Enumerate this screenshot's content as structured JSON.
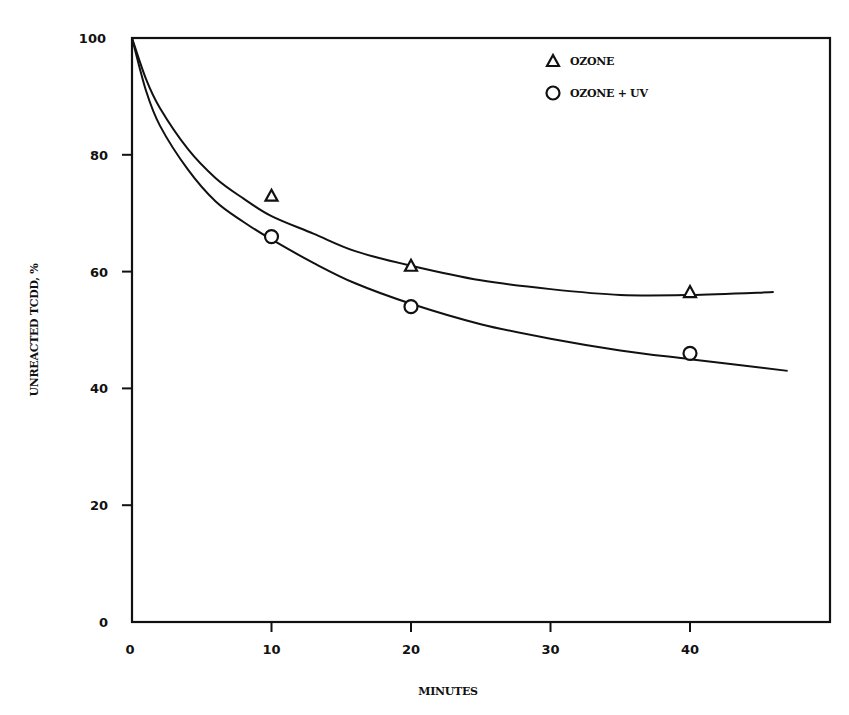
{
  "chart_data": {
    "type": "scatter",
    "title": "",
    "xlabel": "MINUTES",
    "ylabel": "UNREACTED TCDD, %",
    "xlim": [
      0,
      50
    ],
    "ylim": [
      0,
      100
    ],
    "xticks": [
      0,
      10,
      20,
      30,
      40
    ],
    "yticks": [
      0,
      20,
      40,
      60,
      80,
      100
    ],
    "grid": false,
    "legend_position": "upper right inside",
    "series": [
      {
        "name": "OZONE",
        "marker": "triangle",
        "points": [
          {
            "x": 10,
            "y": 73
          },
          {
            "x": 20,
            "y": 61
          },
          {
            "x": 40,
            "y": 56.5
          }
        ],
        "fit_curve": [
          {
            "x": 0,
            "y": 100
          },
          {
            "x": 1,
            "y": 93
          },
          {
            "x": 2,
            "y": 88
          },
          {
            "x": 4,
            "y": 81
          },
          {
            "x": 6,
            "y": 76
          },
          {
            "x": 8,
            "y": 72.5
          },
          {
            "x": 10,
            "y": 69.5
          },
          {
            "x": 13,
            "y": 66.5
          },
          {
            "x": 16,
            "y": 63.5
          },
          {
            "x": 20,
            "y": 61
          },
          {
            "x": 25,
            "y": 58.5
          },
          {
            "x": 30,
            "y": 57
          },
          {
            "x": 35,
            "y": 56
          },
          {
            "x": 40,
            "y": 56
          },
          {
            "x": 46,
            "y": 56.5
          }
        ]
      },
      {
        "name": "OZONE + UV",
        "marker": "circle",
        "points": [
          {
            "x": 10,
            "y": 66
          },
          {
            "x": 20,
            "y": 54
          },
          {
            "x": 40,
            "y": 46
          }
        ],
        "fit_curve": [
          {
            "x": 0,
            "y": 100
          },
          {
            "x": 1,
            "y": 91
          },
          {
            "x": 2,
            "y": 85
          },
          {
            "x": 4,
            "y": 77.5
          },
          {
            "x": 6,
            "y": 72
          },
          {
            "x": 8,
            "y": 68.5
          },
          {
            "x": 10,
            "y": 65.5
          },
          {
            "x": 13,
            "y": 61.5
          },
          {
            "x": 16,
            "y": 58
          },
          {
            "x": 20,
            "y": 54.5
          },
          {
            "x": 25,
            "y": 51
          },
          {
            "x": 30,
            "y": 48.5
          },
          {
            "x": 35,
            "y": 46.5
          },
          {
            "x": 40,
            "y": 45
          },
          {
            "x": 47,
            "y": 43
          }
        ]
      }
    ]
  },
  "legend": {
    "items": [
      {
        "label": "OZONE",
        "marker": "triangle-icon"
      },
      {
        "label": "OZONE + UV",
        "marker": "circle-icon"
      }
    ]
  },
  "axes": {
    "x_title": "MINUTES",
    "y_title": "UNREACTED TCDD, %"
  },
  "style": {
    "ink": "#111111",
    "background": "#ffffff"
  }
}
